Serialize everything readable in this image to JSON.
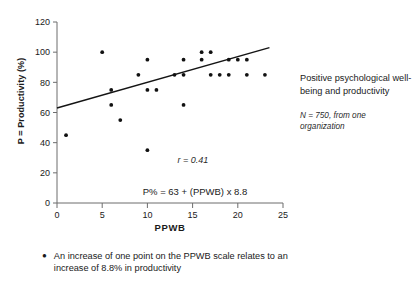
{
  "chart_data": {
    "type": "scatter",
    "title": "",
    "xlabel": "PPWB",
    "ylabel": "P = Productivity (%)",
    "xlim": [
      0,
      25
    ],
    "ylim": [
      0,
      120
    ],
    "xticks": [
      0,
      5,
      10,
      15,
      20,
      25
    ],
    "yticks": [
      0,
      20,
      40,
      60,
      80,
      100,
      120
    ],
    "grid": false,
    "legend": "none",
    "points": [
      {
        "x": 1,
        "y": 45
      },
      {
        "x": 5,
        "y": 100
      },
      {
        "x": 6,
        "y": 75
      },
      {
        "x": 6,
        "y": 65
      },
      {
        "x": 7,
        "y": 55
      },
      {
        "x": 9,
        "y": 85
      },
      {
        "x": 10,
        "y": 95
      },
      {
        "x": 10,
        "y": 75
      },
      {
        "x": 10,
        "y": 35
      },
      {
        "x": 11,
        "y": 75
      },
      {
        "x": 13,
        "y": 85
      },
      {
        "x": 14,
        "y": 95
      },
      {
        "x": 14,
        "y": 85
      },
      {
        "x": 14,
        "y": 65
      },
      {
        "x": 16,
        "y": 100
      },
      {
        "x": 16,
        "y": 95
      },
      {
        "x": 17,
        "y": 100
      },
      {
        "x": 17,
        "y": 85
      },
      {
        "x": 18,
        "y": 85
      },
      {
        "x": 19,
        "y": 85
      },
      {
        "x": 19,
        "y": 95
      },
      {
        "x": 20,
        "y": 95
      },
      {
        "x": 21,
        "y": 95
      },
      {
        "x": 21,
        "y": 85
      },
      {
        "x": 23,
        "y": 85
      }
    ],
    "trendline": {
      "x_start": 0,
      "y_start": 63,
      "x_end": 23.5,
      "y_end": 103,
      "intercept": 63,
      "slope": 8.8
    },
    "annotations": {
      "correlation": "r = 0.41",
      "equation": "P% = 63 + (PPWB) x 8.8"
    }
  },
  "side_panel": {
    "title": "Positive psychological well-being and productivity",
    "note": "N = 750, from one organization"
  },
  "bullet": {
    "marker": "●",
    "text": "An increase of one point on the PPWB scale relates to an increase of 8.8% in productivity"
  }
}
